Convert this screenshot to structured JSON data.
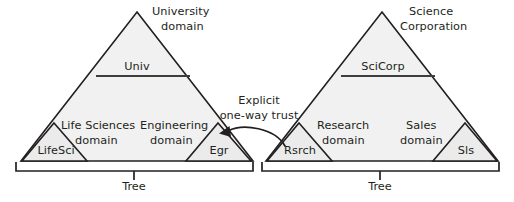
{
  "diagram": {
    "background_color": "#ffffff",
    "line_color": "#231f20",
    "triangle_fill": "#f1f1f1"
  },
  "forests": [
    {
      "name": "university-forest",
      "root": {
        "label_line1": "University",
        "label_line2": "domain",
        "short_name": "Univ"
      },
      "children": [
        {
          "label_line1": "Life Sciences",
          "label_line2": "domain",
          "short_name": "LifeSci"
        },
        {
          "label_line1": "Engineering",
          "label_line2": "domain",
          "short_name": "Egr"
        }
      ],
      "bracket_label": "Tree"
    },
    {
      "name": "science-corporation-forest",
      "root": {
        "label_line1": "Science",
        "label_line2": "Corporation",
        "short_name": "SciCorp"
      },
      "children": [
        {
          "label_line1": "Research",
          "label_line2": "domain",
          "short_name": "Rsrch"
        },
        {
          "label_line1": "Sales",
          "label_line2": "domain",
          "short_name": "Sls"
        }
      ],
      "bracket_label": "Tree"
    }
  ],
  "trust": {
    "label_line1": "Explicit",
    "label_line2": "one-way trust",
    "direction": "from Rsrch to Egr",
    "arrow_icon": "curved-arrow-left-icon"
  }
}
